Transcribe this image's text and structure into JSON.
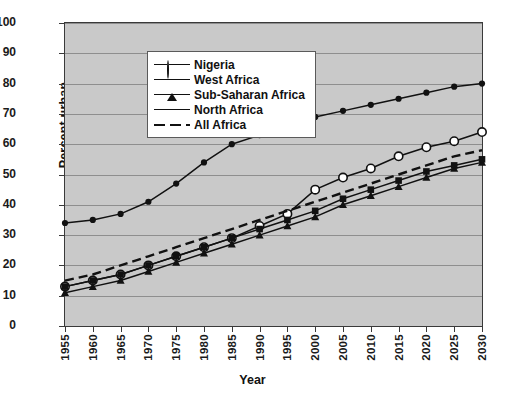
{
  "chart_data": {
    "type": "line",
    "title": "",
    "xlabel": "Year",
    "ylabel": "Percent urban",
    "xlim": [
      1955,
      2030
    ],
    "ylim": [
      0,
      100
    ],
    "grid": true,
    "legend_position": "top-left",
    "x": [
      1955,
      1960,
      1965,
      1970,
      1975,
      1980,
      1985,
      1990,
      1995,
      2000,
      2005,
      2010,
      2015,
      2020,
      2025,
      2030
    ],
    "categories": [
      "1955",
      "1960",
      "1965",
      "1970",
      "1975",
      "1980",
      "1985",
      "1990",
      "1995",
      "2000",
      "2005",
      "2010",
      "2015",
      "2020",
      "2025",
      "2030"
    ],
    "ytick_labels": [
      "0",
      "10",
      "20",
      "30",
      "40",
      "50",
      "60",
      "70",
      "80",
      "90",
      "100"
    ],
    "ytick_values": [
      0,
      10,
      20,
      30,
      40,
      50,
      60,
      70,
      80,
      90,
      100
    ],
    "series": [
      {
        "name": "Nigeria",
        "marker": "open-circle",
        "style": "solid",
        "values": [
          13,
          15,
          17,
          20,
          23,
          26,
          29,
          33,
          37,
          45,
          49,
          52,
          56,
          59,
          61,
          64
        ]
      },
      {
        "name": "West Africa",
        "marker": "triangle",
        "style": "solid",
        "values": [
          11,
          13,
          15,
          18,
          21,
          24,
          27,
          30,
          33,
          36,
          40,
          43,
          46,
          49,
          52,
          54
        ]
      },
      {
        "name": "Sub-Saharan Africa",
        "marker": "square",
        "style": "solid",
        "values": [
          13,
          15,
          17,
          20,
          23,
          26,
          29,
          32,
          35,
          38,
          42,
          45,
          48,
          51,
          53,
          55
        ]
      },
      {
        "name": "North Africa",
        "marker": "filled-circle",
        "style": "solid",
        "values": [
          34,
          35,
          37,
          41,
          47,
          54,
          60,
          63,
          66,
          69,
          71,
          73,
          75,
          77,
          79,
          80
        ]
      },
      {
        "name": "All Africa",
        "marker": "none",
        "style": "dashed",
        "values": [
          15,
          17,
          20,
          23,
          26,
          29,
          32,
          35,
          38,
          41,
          44,
          47,
          50,
          53,
          56,
          58
        ]
      }
    ]
  },
  "legend": {
    "items": [
      {
        "label": "Nigeria"
      },
      {
        "label": "West Africa"
      },
      {
        "label": "Sub-Saharan Africa"
      },
      {
        "label": "North Africa"
      },
      {
        "label": "All Africa"
      }
    ]
  },
  "colors": {
    "plot_background": "#c9c9c9",
    "gridline": "#8e8e8e",
    "axis": "#3a3a3a",
    "series": "#111111",
    "legend_background": "#ffffff"
  }
}
